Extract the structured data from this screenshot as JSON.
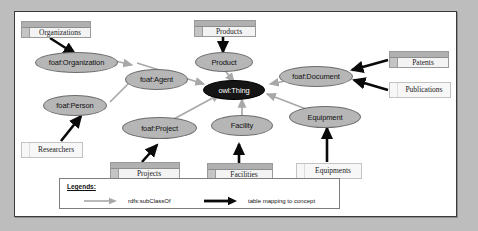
{
  "diagram": {
    "colors": {
      "node_fill": "#b6b6b6",
      "node_root_fill": "#151515",
      "subclass_edge": "#a8a8a8",
      "mapping_edge": "#000000",
      "table_fill": "#f3f3f3",
      "frame_border": "#3a3a3a",
      "page_background": "#bdbdbd"
    },
    "nodes": [
      {
        "id": "foaf-organization",
        "label": "foaf:Organization",
        "style": "light"
      },
      {
        "id": "foaf-agent",
        "label": "foaf:Agent",
        "style": "light"
      },
      {
        "id": "foaf-person",
        "label": "foaf:Person",
        "style": "light"
      },
      {
        "id": "foaf-project",
        "label": "foaf:Project",
        "style": "light"
      },
      {
        "id": "product",
        "label": "Product",
        "style": "light"
      },
      {
        "id": "owl-thing",
        "label": "owl:Thing",
        "style": "dark"
      },
      {
        "id": "foaf-document",
        "label": "foaf:Document",
        "style": "light"
      },
      {
        "id": "facility",
        "label": "Facility",
        "style": "light"
      },
      {
        "id": "equipment",
        "label": "Equipment",
        "style": "light"
      }
    ],
    "tables": [
      {
        "id": "organizations",
        "label": "Organizations",
        "style": "header"
      },
      {
        "id": "products",
        "label": "Products",
        "style": "header"
      },
      {
        "id": "patents",
        "label": "Patents",
        "style": "header"
      },
      {
        "id": "publications",
        "label": "Publications",
        "style": "flat"
      },
      {
        "id": "researchers",
        "label": "Researchers",
        "style": "flat"
      },
      {
        "id": "projects",
        "label": "Projects",
        "style": "header"
      },
      {
        "id": "facilities",
        "label": "Facilities",
        "style": "header"
      },
      {
        "id": "equipments",
        "label": "Equipments",
        "style": "flat"
      }
    ],
    "edges": [
      {
        "from": "product",
        "to": "owl-thing",
        "type": "rdfs:subClassOf"
      },
      {
        "from": "foaf-agent",
        "to": "owl-thing",
        "type": "rdfs:subClassOf"
      },
      {
        "from": "foaf-document",
        "to": "owl-thing",
        "type": "rdfs:subClassOf"
      },
      {
        "from": "foaf-project",
        "to": "owl-thing",
        "type": "rdfs:subClassOf"
      },
      {
        "from": "facility",
        "to": "owl-thing",
        "type": "rdfs:subClassOf"
      },
      {
        "from": "equipment",
        "to": "owl-thing",
        "type": "rdfs:subClassOf"
      },
      {
        "from": "foaf-organization",
        "to": "foaf-agent",
        "type": "rdfs:subClassOf"
      },
      {
        "from": "foaf-person",
        "to": "foaf-agent",
        "type": "rdfs:subClassOf"
      },
      {
        "from": "organizations",
        "to": "foaf-organization",
        "type": "table mapping to concept"
      },
      {
        "from": "researchers",
        "to": "foaf-person",
        "type": "table mapping to concept"
      },
      {
        "from": "products",
        "to": "product",
        "type": "table mapping to concept"
      },
      {
        "from": "patents",
        "to": "foaf-document",
        "type": "table mapping to concept"
      },
      {
        "from": "publications",
        "to": "foaf-document",
        "type": "table mapping to concept"
      },
      {
        "from": "projects",
        "to": "foaf-project",
        "type": "table mapping to concept"
      },
      {
        "from": "facilities",
        "to": "facility",
        "type": "table mapping to concept"
      },
      {
        "from": "equipments",
        "to": "equipment",
        "type": "table mapping to concept"
      }
    ],
    "legend": {
      "title": "Legends:",
      "entries": [
        {
          "icon": "gray-arrow-icon",
          "label": "rdfs:subClassOf"
        },
        {
          "icon": "black-arrow-icon",
          "label": "table mapping to concept"
        }
      ]
    }
  }
}
